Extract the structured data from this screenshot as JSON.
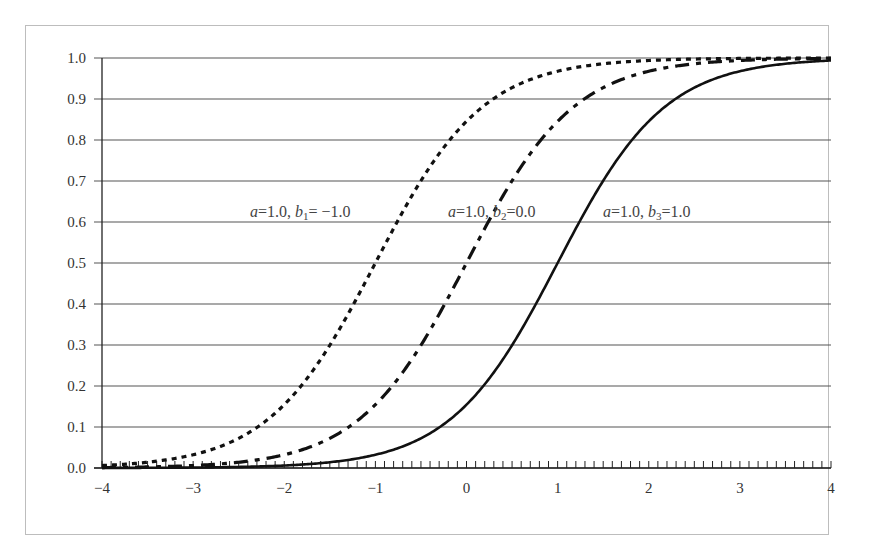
{
  "chart_data": {
    "type": "line",
    "title": "",
    "xlabel": "",
    "ylabel": "",
    "xlim": [
      -4,
      4
    ],
    "ylim": [
      0.0,
      1.0
    ],
    "grid": {
      "horizontal": true,
      "vertical": false
    },
    "legend": null,
    "x_ticks": [
      "−4",
      "−3",
      "−2",
      "−1",
      "0",
      "1",
      "2",
      "3",
      "4"
    ],
    "x_tick_values": [
      -4,
      -3,
      -2,
      -1,
      0,
      1,
      2,
      3,
      4
    ],
    "x_minor_tick_step": 0.1,
    "y_ticks": [
      "0.0",
      "0.1",
      "0.2",
      "0.3",
      "0.4",
      "0.5",
      "0.6",
      "0.7",
      "0.8",
      "0.9",
      "1.0"
    ],
    "y_tick_values": [
      0.0,
      0.1,
      0.2,
      0.3,
      0.4,
      0.5,
      0.6,
      0.7,
      0.8,
      0.9,
      1.0
    ],
    "model": "P(x) = 1 / (1 + exp(-1.7 * a * (x - b)))",
    "x": [
      -4,
      -3.5,
      -3,
      -2.5,
      -2,
      -1.5,
      -1,
      -0.5,
      0,
      0.5,
      1,
      1.5,
      2,
      2.5,
      3,
      3.5,
      4
    ],
    "series": [
      {
        "name": "a=1.0, b1=-1.0",
        "a": 1.0,
        "b": -1.0,
        "style": "dotted",
        "values": [
          0.006,
          0.014,
          0.032,
          0.072,
          0.154,
          0.3,
          0.5,
          0.7,
          0.846,
          0.928,
          0.968,
          0.986,
          0.994,
          0.997,
          0.999,
          0.9995,
          0.9998
        ]
      },
      {
        "name": "a=1.0, b2=0.0",
        "a": 1.0,
        "b": 0.0,
        "style": "dash-dot",
        "values": [
          0.001,
          0.003,
          0.006,
          0.014,
          0.032,
          0.072,
          0.154,
          0.3,
          0.5,
          0.7,
          0.846,
          0.928,
          0.968,
          0.986,
          0.994,
          0.997,
          0.999
        ]
      },
      {
        "name": "a=1.0, b3=1.0",
        "a": 1.0,
        "b": 1.0,
        "style": "solid",
        "values": [
          0.0002,
          0.0005,
          0.001,
          0.003,
          0.006,
          0.014,
          0.032,
          0.072,
          0.154,
          0.3,
          0.5,
          0.7,
          0.846,
          0.928,
          0.968,
          0.986,
          0.994
        ]
      }
    ],
    "annotations": [
      {
        "text": "a=1.0, b1= −1.0",
        "x": -2.65,
        "y": 0.61
      },
      {
        "text": "a=1.0, b2=0.0",
        "x": -0.25,
        "y": 0.61
      },
      {
        "text": "a=1.0, b3=1.0",
        "x": 1.7,
        "y": 0.61
      }
    ]
  },
  "labels": {
    "annot1": {
      "a": "a",
      "eq1": "=1.0, ",
      "b": "b",
      "sub": "1",
      "eq2": "= −1.0"
    },
    "annot2": {
      "a": "a",
      "eq1": "=1.0, ",
      "b": "b",
      "sub": "2",
      "eq2": "=0.0"
    },
    "annot3": {
      "a": "a",
      "eq1": "=1.0, ",
      "b": "b",
      "sub": "3",
      "eq2": "=1.0"
    }
  },
  "colors": {
    "line": "#111111",
    "grid": "#555555",
    "frame": "#bdbdbd",
    "text": "#333333"
  }
}
